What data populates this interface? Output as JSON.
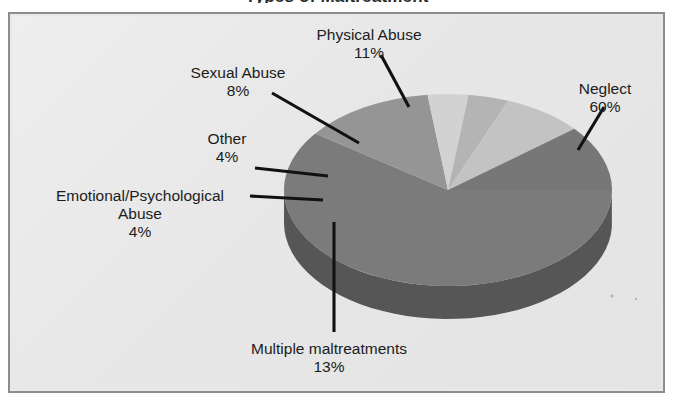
{
  "page": {
    "background_color": "#ffffff",
    "clipped_title_remnant": "Types of Maltreatment"
  },
  "frame": {
    "background_color": "#e9e9e9",
    "border_color": "#8d8d8d"
  },
  "chart_data": {
    "type": "pie",
    "title": "",
    "xlabel": "",
    "ylabel": "",
    "style": "3d-exploded-grayscale",
    "legend_position": "callout-labels",
    "grid": false,
    "units": "percent",
    "categories": [
      "Neglect",
      "Multiple maltreatments",
      "Emotional/Psychological Abuse",
      "Other",
      "Sexual Abuse",
      "Physical Abuse"
    ],
    "values": [
      60,
      13,
      4,
      4,
      8,
      11
    ],
    "slices": [
      {
        "name": "neglect",
        "label": "Neglect",
        "label_lines": [
          "Neglect"
        ],
        "percent_text": "60%",
        "value": 60,
        "color": "#7b7b7b",
        "side_color": "#565656"
      },
      {
        "name": "multiple-maltreatments",
        "label": "Multiple maltreatments",
        "label_lines": [
          "Multiple maltreatments"
        ],
        "percent_text": "13%",
        "value": 13,
        "color": "#959595",
        "side_color": "#6a6a6a"
      },
      {
        "name": "emotional-psychological-abuse",
        "label": "Emotional/Psychological Abuse",
        "label_lines": [
          "Emotional/Psychological",
          "Abuse"
        ],
        "percent_text": "4%",
        "value": 4,
        "color": "#d2d2d2",
        "side_color": "#a4a4a4"
      },
      {
        "name": "other",
        "label": "Other",
        "label_lines": [
          "Other"
        ],
        "percent_text": "4%",
        "value": 4,
        "color": "#b4b4b4",
        "side_color": "#8a8a8a"
      },
      {
        "name": "sexual-abuse",
        "label": "Sexual Abuse",
        "label_lines": [
          "Sexual Abuse"
        ],
        "percent_text": "8%",
        "value": 8,
        "color": "#c3c3c3",
        "side_color": "#949494"
      },
      {
        "name": "physical-abuse",
        "label": "Physical Abuse",
        "label_lines": [
          "Physical Abuse"
        ],
        "percent_text": "11%",
        "value": 11,
        "color": "#777777",
        "side_color": "#545454"
      }
    ]
  },
  "labels": {
    "physical_abuse": {
      "line1": "Physical Abuse",
      "pct": "11%"
    },
    "sexual_abuse": {
      "line1": "Sexual Abuse",
      "pct": "8%"
    },
    "other": {
      "line1": "Other",
      "pct": "4%"
    },
    "emotional": {
      "line1": "Emotional/Psychological",
      "line2": "Abuse",
      "pct": "4%"
    },
    "neglect": {
      "line1": "Neglect",
      "pct": "60%"
    },
    "multiple": {
      "line1": "Multiple maltreatments",
      "pct": "13%"
    }
  }
}
